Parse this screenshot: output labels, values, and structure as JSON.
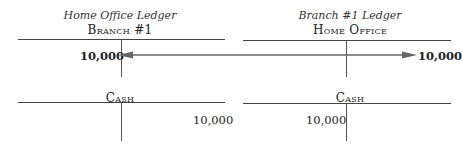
{
  "left_ledger": {
    "title": "Home Office Ledger",
    "top_account": {
      "name": "Branch #1",
      "debit": "10,000",
      "credit": ""
    },
    "bottom_account": {
      "name": "Cash",
      "debit": "",
      "credit": "10,000"
    }
  },
  "right_ledger": {
    "title": "Branch #1 Ledger",
    "top_account": {
      "name": "Home Office",
      "debit": "",
      "credit": "10,000"
    },
    "bottom_account": {
      "name": "Cash",
      "debit": "10,000",
      "credit": ""
    }
  },
  "arrow": {
    "style": "double-headed",
    "connects": [
      "Branch #1 debit",
      "Home Office credit"
    ],
    "color": "#666666"
  }
}
